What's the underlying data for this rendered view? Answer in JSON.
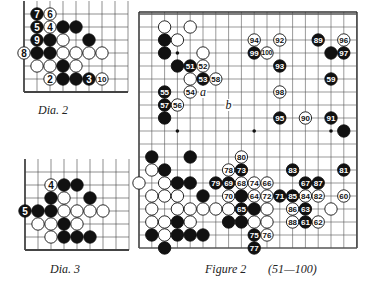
{
  "dia2": {
    "caption": "Dia.   2",
    "origin": [
      24,
      14
    ],
    "spacing": 13,
    "cols": 8,
    "rows": 6,
    "top_open": true,
    "right_open": true,
    "stones": [
      {
        "c": 1,
        "r": 0,
        "color": "B",
        "label": "7"
      },
      {
        "c": 2,
        "r": 0,
        "color": "W",
        "label": "6"
      },
      {
        "c": 1,
        "r": 1,
        "color": "B",
        "label": "5"
      },
      {
        "c": 2,
        "r": 1,
        "color": "W",
        "label": "4"
      },
      {
        "c": 3,
        "r": 1,
        "color": "B",
        "label": ""
      },
      {
        "c": 4,
        "r": 1,
        "color": "B",
        "label": ""
      },
      {
        "c": 1,
        "r": 2,
        "color": "B",
        "label": "9"
      },
      {
        "c": 2,
        "r": 2,
        "color": "B",
        "label": ""
      },
      {
        "c": 3,
        "r": 2,
        "color": "W",
        "label": ""
      },
      {
        "c": 5,
        "r": 2,
        "color": "B",
        "label": ""
      },
      {
        "c": 0,
        "r": 3,
        "color": "W",
        "label": "8"
      },
      {
        "c": 1,
        "r": 3,
        "color": "B",
        "label": ""
      },
      {
        "c": 2,
        "r": 3,
        "color": "B",
        "label": ""
      },
      {
        "c": 3,
        "r": 3,
        "color": "W",
        "label": ""
      },
      {
        "c": 4,
        "r": 3,
        "color": "W",
        "label": ""
      },
      {
        "c": 5,
        "r": 3,
        "color": "W",
        "label": ""
      },
      {
        "c": 6,
        "r": 3,
        "color": "W",
        "label": ""
      },
      {
        "c": 1,
        "r": 4,
        "color": "W",
        "label": ""
      },
      {
        "c": 2,
        "r": 4,
        "color": "W",
        "label": ""
      },
      {
        "c": 3,
        "r": 4,
        "color": "B",
        "label": ""
      },
      {
        "c": 4,
        "r": 4,
        "color": "W",
        "label": ""
      },
      {
        "c": 2,
        "r": 5,
        "color": "W",
        "label": "2"
      },
      {
        "c": 3,
        "r": 5,
        "color": "B",
        "label": ""
      },
      {
        "c": 4,
        "r": 5,
        "color": "B",
        "label": ""
      },
      {
        "c": 5,
        "r": 5,
        "color": "B",
        "label": "3"
      },
      {
        "c": 6,
        "r": 5,
        "color": "W",
        "label": "10"
      }
    ]
  },
  "dia3": {
    "caption": "Dia.   3",
    "origin": [
      25,
      172
    ],
    "spacing": 13,
    "cols": 8,
    "rows": 6,
    "top_open": true,
    "right_open": true,
    "stones": [
      {
        "c": 2,
        "r": 1,
        "color": "W",
        "label": "4"
      },
      {
        "c": 3,
        "r": 1,
        "color": "B",
        "label": ""
      },
      {
        "c": 4,
        "r": 1,
        "color": "B",
        "label": ""
      },
      {
        "c": 2,
        "r": 2,
        "color": "B",
        "label": ""
      },
      {
        "c": 3,
        "r": 2,
        "color": "W",
        "label": ""
      },
      {
        "c": 5,
        "r": 2,
        "color": "B",
        "label": ""
      },
      {
        "c": 0,
        "r": 3,
        "color": "B",
        "label": "5"
      },
      {
        "c": 1,
        "r": 3,
        "color": "B",
        "label": ""
      },
      {
        "c": 2,
        "r": 3,
        "color": "B",
        "label": ""
      },
      {
        "c": 3,
        "r": 3,
        "color": "W",
        "label": ""
      },
      {
        "c": 4,
        "r": 3,
        "color": "W",
        "label": ""
      },
      {
        "c": 5,
        "r": 3,
        "color": "W",
        "label": ""
      },
      {
        "c": 6,
        "r": 3,
        "color": "W",
        "label": ""
      },
      {
        "c": 1,
        "r": 4,
        "color": "W",
        "label": ""
      },
      {
        "c": 2,
        "r": 4,
        "color": "W",
        "label": ""
      },
      {
        "c": 3,
        "r": 4,
        "color": "B",
        "label": ""
      },
      {
        "c": 4,
        "r": 4,
        "color": "W",
        "label": ""
      },
      {
        "c": 2,
        "r": 5,
        "color": "W",
        "label": ""
      },
      {
        "c": 3,
        "r": 5,
        "color": "B",
        "label": ""
      },
      {
        "c": 4,
        "r": 5,
        "color": "B",
        "label": ""
      },
      {
        "c": 5,
        "r": 5,
        "color": "B",
        "label": ""
      }
    ]
  },
  "figure2": {
    "caption": "Figure 2",
    "range": "(51—100)",
    "origin": [
      139,
      14
    ],
    "spacing_x": 12.8,
    "spacing_y": 13,
    "cols": 18,
    "rows": 19,
    "star_points": [
      [
        3,
        3
      ],
      [
        3,
        9
      ],
      [
        9,
        9
      ],
      [
        15,
        9
      ]
    ],
    "letters": [
      {
        "c": 5,
        "r": 6,
        "text": "a"
      },
      {
        "c": 7,
        "r": 7,
        "text": "b"
      }
    ],
    "stones": [
      {
        "c": 2,
        "r": 1,
        "color": "W",
        "label": ""
      },
      {
        "c": 4,
        "r": 1,
        "color": "W",
        "label": ""
      },
      {
        "c": 2,
        "r": 2,
        "color": "B",
        "label": ""
      },
      {
        "c": 3,
        "r": 2,
        "color": "W",
        "label": ""
      },
      {
        "c": 2,
        "r": 3,
        "color": "B",
        "label": ""
      },
      {
        "c": 5,
        "r": 3,
        "color": "W",
        "label": ""
      },
      {
        "c": 3,
        "r": 4,
        "color": "B",
        "label": ""
      },
      {
        "c": 4,
        "r": 4,
        "color": "B",
        "label": "51"
      },
      {
        "c": 5,
        "r": 4,
        "color": "W",
        "label": "52"
      },
      {
        "c": 4,
        "r": 5,
        "color": "W",
        "label": ""
      },
      {
        "c": 5,
        "r": 5,
        "color": "B",
        "label": "53"
      },
      {
        "c": 6,
        "r": 5,
        "color": "W",
        "label": "58"
      },
      {
        "c": 2,
        "r": 6,
        "color": "B",
        "label": "55"
      },
      {
        "c": 4,
        "r": 6,
        "color": "W",
        "label": "54"
      },
      {
        "c": 2,
        "r": 7,
        "color": "B",
        "label": "57"
      },
      {
        "c": 3,
        "r": 7,
        "color": "W",
        "label": "56"
      },
      {
        "c": 2,
        "r": 8,
        "color": "B",
        "label": ""
      },
      {
        "c": 9,
        "r": 2,
        "color": "W",
        "label": "94"
      },
      {
        "c": 11,
        "r": 2,
        "color": "W",
        "label": "92"
      },
      {
        "c": 14,
        "r": 2,
        "color": "B",
        "label": "89"
      },
      {
        "c": 16,
        "r": 2,
        "color": "W",
        "label": "96"
      },
      {
        "c": 9,
        "r": 3,
        "color": "B",
        "label": "99"
      },
      {
        "c": 10,
        "r": 3,
        "color": "W",
        "label": "100"
      },
      {
        "c": 15,
        "r": 3,
        "color": "B",
        "label": ""
      },
      {
        "c": 16,
        "r": 3,
        "color": "B",
        "label": "97"
      },
      {
        "c": 11,
        "r": 4,
        "color": "B",
        "label": "93"
      },
      {
        "c": 15,
        "r": 5,
        "color": "B",
        "label": "59"
      },
      {
        "c": 11,
        "r": 6,
        "color": "W",
        "label": "98"
      },
      {
        "c": 11,
        "r": 8,
        "color": "B",
        "label": "95"
      },
      {
        "c": 13,
        "r": 8,
        "color": "W",
        "label": "90"
      },
      {
        "c": 15,
        "r": 8,
        "color": "B",
        "label": "91"
      },
      {
        "c": 16,
        "r": 9,
        "color": "B",
        "label": ""
      },
      {
        "c": 1,
        "r": 11,
        "color": "B",
        "label": ""
      },
      {
        "c": 4,
        "r": 11,
        "color": "B",
        "label": ""
      },
      {
        "c": 8,
        "r": 11,
        "color": "W",
        "label": "80"
      },
      {
        "c": 1,
        "r": 12,
        "color": "W",
        "label": ""
      },
      {
        "c": 2,
        "r": 12,
        "color": "B",
        "label": ""
      },
      {
        "c": 7,
        "r": 12,
        "color": "W",
        "label": "78"
      },
      {
        "c": 8,
        "r": 12,
        "color": "B",
        "label": "73"
      },
      {
        "c": 12,
        "r": 12,
        "color": "B",
        "label": "83"
      },
      {
        "c": 16,
        "r": 12,
        "color": "B",
        "label": "81"
      },
      {
        "c": 0,
        "r": 13,
        "color": "W",
        "label": ""
      },
      {
        "c": 2,
        "r": 13,
        "color": "W",
        "label": ""
      },
      {
        "c": 3,
        "r": 13,
        "color": "B",
        "label": ""
      },
      {
        "c": 4,
        "r": 13,
        "color": "B",
        "label": ""
      },
      {
        "c": 6,
        "r": 13,
        "color": "B",
        "label": "79"
      },
      {
        "c": 7,
        "r": 13,
        "color": "B",
        "label": "69"
      },
      {
        "c": 8,
        "r": 13,
        "color": "W",
        "label": "68"
      },
      {
        "c": 9,
        "r": 13,
        "color": "W",
        "label": "74"
      },
      {
        "c": 10,
        "r": 13,
        "color": "W",
        "label": "66"
      },
      {
        "c": 13,
        "r": 13,
        "color": "B",
        "label": "67"
      },
      {
        "c": 14,
        "r": 13,
        "color": "B",
        "label": "87"
      },
      {
        "c": 1,
        "r": 14,
        "color": "W",
        "label": ""
      },
      {
        "c": 2,
        "r": 14,
        "color": "W",
        "label": ""
      },
      {
        "c": 3,
        "r": 14,
        "color": "W",
        "label": ""
      },
      {
        "c": 5,
        "r": 14,
        "color": "B",
        "label": ""
      },
      {
        "c": 7,
        "r": 14,
        "color": "W",
        "label": "70"
      },
      {
        "c": 8,
        "r": 14,
        "color": "B",
        "label": ""
      },
      {
        "c": 9,
        "r": 14,
        "color": "W",
        "label": "64"
      },
      {
        "c": 10,
        "r": 14,
        "color": "W",
        "label": "72"
      },
      {
        "c": 11,
        "r": 14,
        "color": "B",
        "label": "71"
      },
      {
        "c": 12,
        "r": 14,
        "color": "B",
        "label": "85"
      },
      {
        "c": 13,
        "r": 14,
        "color": "W",
        "label": "84"
      },
      {
        "c": 14,
        "r": 14,
        "color": "W",
        "label": "82"
      },
      {
        "c": 16,
        "r": 14,
        "color": "W",
        "label": "60"
      },
      {
        "c": 1,
        "r": 15,
        "color": "W",
        "label": ""
      },
      {
        "c": 3,
        "r": 15,
        "color": "W",
        "label": ""
      },
      {
        "c": 4,
        "r": 15,
        "color": "W",
        "label": ""
      },
      {
        "c": 5,
        "r": 15,
        "color": "W",
        "label": ""
      },
      {
        "c": 6,
        "r": 15,
        "color": "W",
        "label": ""
      },
      {
        "c": 7,
        "r": 15,
        "color": "W",
        "label": ""
      },
      {
        "c": 8,
        "r": 15,
        "color": "B",
        "label": "65"
      },
      {
        "c": 9,
        "r": 15,
        "color": "B",
        "label": ""
      },
      {
        "c": 10,
        "r": 15,
        "color": "W",
        "label": ""
      },
      {
        "c": 12,
        "r": 15,
        "color": "W",
        "label": "86"
      },
      {
        "c": 13,
        "r": 15,
        "color": "B",
        "label": "63"
      },
      {
        "c": 15,
        "r": 15,
        "color": "W",
        "label": ""
      },
      {
        "c": 1,
        "r": 16,
        "color": "W",
        "label": ""
      },
      {
        "c": 2,
        "r": 16,
        "color": "W",
        "label": ""
      },
      {
        "c": 3,
        "r": 16,
        "color": "B",
        "label": ""
      },
      {
        "c": 4,
        "r": 16,
        "color": "W",
        "label": ""
      },
      {
        "c": 7,
        "r": 16,
        "color": "B",
        "label": ""
      },
      {
        "c": 8,
        "r": 16,
        "color": "B",
        "label": ""
      },
      {
        "c": 9,
        "r": 16,
        "color": "W",
        "label": ""
      },
      {
        "c": 10,
        "r": 16,
        "color": "W",
        "label": ""
      },
      {
        "c": 12,
        "r": 16,
        "color": "W",
        "label": "88"
      },
      {
        "c": 13,
        "r": 16,
        "color": "B",
        "label": "61"
      },
      {
        "c": 14,
        "r": 16,
        "color": "W",
        "label": "62"
      },
      {
        "c": 1,
        "r": 17,
        "color": "B",
        "label": ""
      },
      {
        "c": 2,
        "r": 17,
        "color": "W",
        "label": ""
      },
      {
        "c": 3,
        "r": 17,
        "color": "B",
        "label": ""
      },
      {
        "c": 4,
        "r": 17,
        "color": "B",
        "label": ""
      },
      {
        "c": 5,
        "r": 17,
        "color": "B",
        "label": ""
      },
      {
        "c": 9,
        "r": 17,
        "color": "B",
        "label": "75"
      },
      {
        "c": 10,
        "r": 17,
        "color": "W",
        "label": "76"
      },
      {
        "c": 2,
        "r": 18,
        "color": "B",
        "label": ""
      },
      {
        "c": 9,
        "r": 18,
        "color": "B",
        "label": "77"
      }
    ]
  }
}
